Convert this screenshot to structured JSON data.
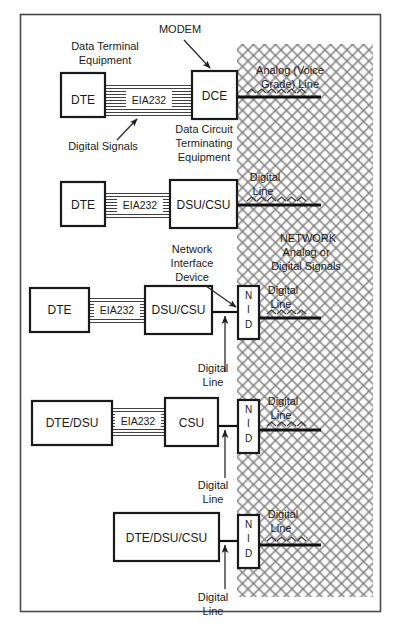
{
  "diagram": {
    "colors": {
      "line": "#111111",
      "frame": "#4a4a4a",
      "hatch": "#808080",
      "text": "#1a1a1a",
      "background": "#ffffff"
    },
    "network_region": {
      "label_line1": "NETWORK",
      "label_line2": "Analog or",
      "label_line3": "Digital Signals"
    },
    "callouts": {
      "modem": "MODEM",
      "data_terminal_equipment_line1": "Data Terminal",
      "data_terminal_equipment_line2": "Equipment",
      "digital_signals": "Digital Signals",
      "data_circuit_line1": "Data Circuit",
      "data_circuit_line2": "Terminating",
      "data_circuit_line3": "Equipment",
      "network_interface_device_line1": "Network",
      "network_interface_device_line2": "Interface",
      "network_interface_device_line3": "Device"
    },
    "line_labels": {
      "analog_voice_grade_line1": "Analog (Voice",
      "analog_voice_grade_line2": "Grade) Line",
      "digital_line_word1": "Digital",
      "digital_line_word2": "Line"
    },
    "cable_label": "EIA232",
    "nid_letters": [
      "N",
      "I",
      "D"
    ],
    "rows": [
      {
        "id": "row-1-modem",
        "left_device": "DTE",
        "right_device": "DCE",
        "cable": "EIA232",
        "network_line_type": "Analog (Voice Grade) Line",
        "has_nid": false
      },
      {
        "id": "row-2-dsucsu",
        "left_device": "DTE",
        "right_device": "DSU/CSU",
        "cable": "EIA232",
        "network_line_type": "Digital Line",
        "has_nid": false
      },
      {
        "id": "row-3-dsucsu-nid",
        "left_device": "DTE",
        "right_device": "DSU/CSU",
        "cable": "EIA232",
        "network_line_type": "Digital Line",
        "has_nid": true,
        "nid": "NID"
      },
      {
        "id": "row-4-csu-nid",
        "left_device": "DTE/DSU",
        "right_device": "CSU",
        "cable": "EIA232",
        "network_line_type": "Digital Line",
        "has_nid": true,
        "nid": "NID"
      },
      {
        "id": "row-5-integrated-nid",
        "left_device": "DTE/DSU/CSU",
        "right_device": "",
        "cable": "",
        "network_line_type": "Digital Line",
        "has_nid": true,
        "nid": "NID"
      }
    ]
  }
}
